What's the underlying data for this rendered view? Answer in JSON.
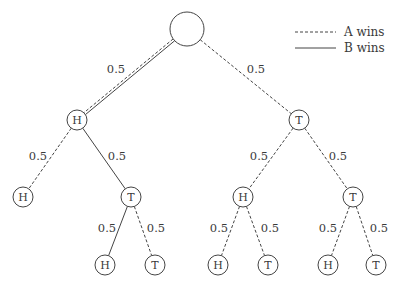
{
  "legend": {
    "items": [
      {
        "label": "A wins",
        "style": "dashed"
      },
      {
        "label": "B wins",
        "style": "solid"
      }
    ]
  },
  "colors": {
    "stroke": "#444444",
    "text": "#3a3a3a",
    "background": "#ffffff"
  },
  "tree": {
    "nodes": [
      {
        "id": "root",
        "label": "",
        "x": 187,
        "y": 29,
        "r": 17
      },
      {
        "id": "h1",
        "label": "H",
        "x": 77,
        "y": 120,
        "r": 10
      },
      {
        "id": "t1",
        "label": "T",
        "x": 299,
        "y": 120,
        "r": 10
      },
      {
        "id": "hh",
        "label": "H",
        "x": 23,
        "y": 197,
        "r": 10
      },
      {
        "id": "ht",
        "label": "T",
        "x": 131,
        "y": 197,
        "r": 10
      },
      {
        "id": "th",
        "label": "H",
        "x": 243,
        "y": 197,
        "r": 10
      },
      {
        "id": "tt",
        "label": "T",
        "x": 353,
        "y": 197,
        "r": 10
      },
      {
        "id": "hth",
        "label": "H",
        "x": 105,
        "y": 265,
        "r": 10
      },
      {
        "id": "htt",
        "label": "T",
        "x": 155,
        "y": 265,
        "r": 10
      },
      {
        "id": "thh",
        "label": "H",
        "x": 218,
        "y": 265,
        "r": 10
      },
      {
        "id": "tht",
        "label": "T",
        "x": 268,
        "y": 265,
        "r": 10
      },
      {
        "id": "tth",
        "label": "H",
        "x": 328,
        "y": 265,
        "r": 10
      },
      {
        "id": "ttt",
        "label": "T",
        "x": 376,
        "y": 265,
        "r": 10
      }
    ],
    "edges": [
      {
        "from": "root",
        "to": "h1",
        "prob": "0.5",
        "style": "both",
        "lx": 116,
        "ly": 73
      },
      {
        "from": "root",
        "to": "t1",
        "prob": "0.5",
        "style": "dashed",
        "lx": 256,
        "ly": 73
      },
      {
        "from": "h1",
        "to": "hh",
        "prob": "0.5",
        "style": "dashed",
        "lx": 38,
        "ly": 160
      },
      {
        "from": "h1",
        "to": "ht",
        "prob": "0.5",
        "style": "solid",
        "lx": 117,
        "ly": 160
      },
      {
        "from": "t1",
        "to": "th",
        "prob": "0.5",
        "style": "dashed",
        "lx": 259,
        "ly": 160
      },
      {
        "from": "t1",
        "to": "tt",
        "prob": "0.5",
        "style": "dashed",
        "lx": 338,
        "ly": 160
      },
      {
        "from": "ht",
        "to": "hth",
        "prob": "0.5",
        "style": "solid",
        "lx": 107,
        "ly": 232
      },
      {
        "from": "ht",
        "to": "htt",
        "prob": "0.5",
        "style": "dashed",
        "lx": 156,
        "ly": 232
      },
      {
        "from": "th",
        "to": "thh",
        "prob": "0.5",
        "style": "dashed",
        "lx": 219,
        "ly": 232
      },
      {
        "from": "th",
        "to": "tht",
        "prob": "0.5",
        "style": "dashed",
        "lx": 270,
        "ly": 232
      },
      {
        "from": "tt",
        "to": "tth",
        "prob": "0.5",
        "style": "dashed",
        "lx": 328,
        "ly": 232
      },
      {
        "from": "tt",
        "to": "ttt",
        "prob": "0.5",
        "style": "dashed",
        "lx": 379,
        "ly": 232
      }
    ]
  }
}
